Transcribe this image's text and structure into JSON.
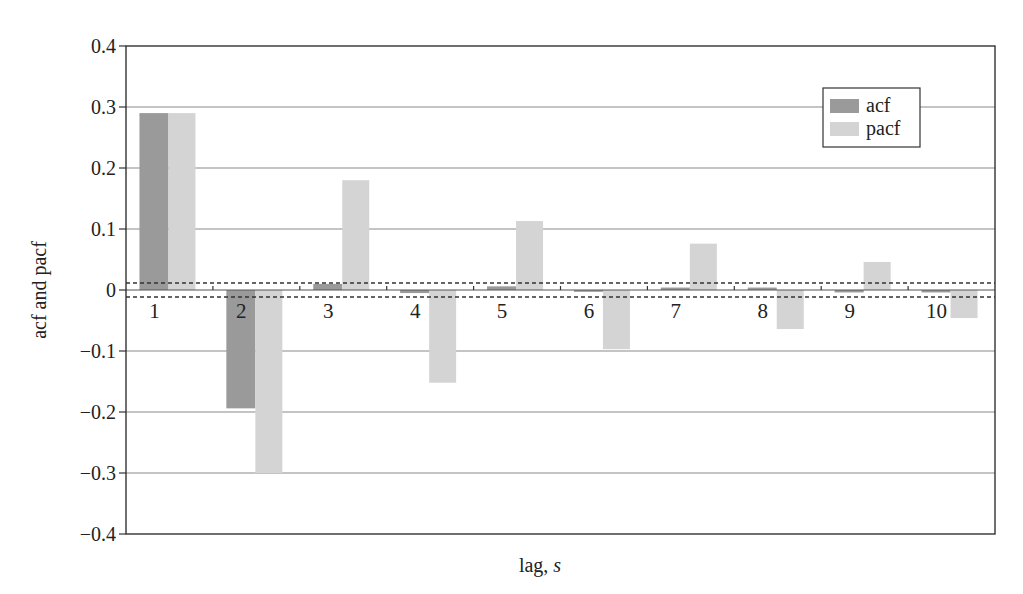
{
  "chart_data": {
    "type": "bar",
    "title": "",
    "xlabel": "lag, s",
    "xlabel_parts": {
      "text": "lag, ",
      "italic": "s"
    },
    "ylabel": "acf and pacf",
    "categories": [
      "1",
      "2",
      "3",
      "4",
      "5",
      "6",
      "7",
      "8",
      "9",
      "10"
    ],
    "series": [
      {
        "name": "acf",
        "color": "#9a9a9a",
        "values": [
          0.29,
          -0.194,
          0.01,
          -0.005,
          0.006,
          -0.003,
          0.004,
          0.004,
          -0.004,
          -0.004
        ]
      },
      {
        "name": "pacf",
        "color": "#d4d4d4",
        "values": [
          0.29,
          -0.3,
          0.18,
          -0.152,
          0.113,
          -0.097,
          0.076,
          -0.064,
          0.046,
          -0.046
        ]
      }
    ],
    "ylim": [
      -0.4,
      0.4
    ],
    "yticks": [
      0.4,
      0.3,
      0.2,
      0.1,
      0,
      -0.1,
      -0.2,
      -0.3,
      -0.4
    ],
    "ytick_labels": [
      "0.4",
      "0.3",
      "0.2",
      "0.1",
      "0",
      "−0.1",
      "−0.2",
      "−0.3",
      "−0.4"
    ],
    "confidence_band": [
      -0.0115,
      0.0115
    ],
    "grid": "horizontal",
    "legend_position": "upper right"
  },
  "legend": {
    "items": [
      "acf",
      "pacf"
    ]
  },
  "axes": {
    "xlabel_text": "lag, ",
    "xlabel_italic": "s",
    "ylabel": "acf and pacf"
  }
}
